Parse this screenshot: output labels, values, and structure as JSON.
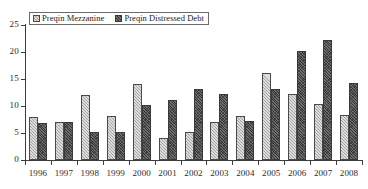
{
  "chart_data": {
    "type": "bar",
    "title": "",
    "subtitle": "",
    "xlabel": "",
    "ylabel": "",
    "categories": [
      "1996",
      "1997",
      "1998",
      "1999",
      "2000",
      "2001",
      "2002",
      "2003",
      "2004",
      "2005",
      "2006",
      "2007",
      "2008"
    ],
    "series": [
      {
        "name": "Preqin Mezzanine",
        "values": [
          8.0,
          7.0,
          12.1,
          8.1,
          14.0,
          4.0,
          5.1,
          7.1,
          8.2,
          16.2,
          12.3,
          10.3,
          8.3
        ],
        "color": "#dcdcdc",
        "pattern": "light-diagonal-hatch"
      },
      {
        "name": "Preqin Distressed Debt",
        "values": [
          6.9,
          7.0,
          5.1,
          5.1,
          10.1,
          11.1,
          13.2,
          12.2,
          7.2,
          13.2,
          20.2,
          22.3,
          14.3
        ],
        "color": "#6e6e6e",
        "pattern": "dark-dense-hatch"
      }
    ],
    "ylim": [
      0,
      25
    ],
    "yticks": [
      0,
      5,
      10,
      15,
      20,
      25
    ],
    "ytick_labels": [
      "0",
      "5",
      "10",
      "15",
      "20",
      "25"
    ],
    "grid": false,
    "legend_position": "top-left-inside"
  }
}
